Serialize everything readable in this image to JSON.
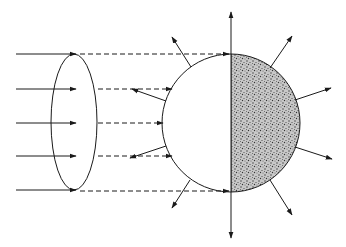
{
  "diagram": {
    "colors": {
      "background": "#ffffff",
      "line": "#1a1a1a",
      "shade": "#7a7a7a"
    },
    "incoming_ray_count": 5,
    "outgoing_arrow_count": 12
  }
}
